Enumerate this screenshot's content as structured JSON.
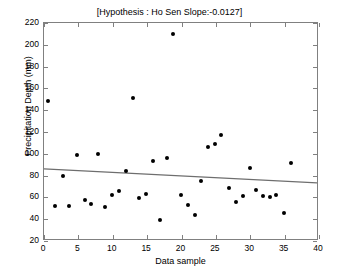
{
  "chart_data": {
    "type": "scatter",
    "title": "[Hypothesis : Ho Sen Slope:-0.0127]",
    "xlabel": "Data sample",
    "ylabel": "Precipitation Depth (mm)",
    "xlim": [
      0,
      40
    ],
    "ylim": [
      20,
      220
    ],
    "xticks": [
      0,
      5,
      10,
      15,
      20,
      25,
      30,
      35,
      40
    ],
    "yticks": [
      20,
      40,
      60,
      80,
      100,
      120,
      140,
      160,
      180,
      200,
      220
    ],
    "grid": false,
    "legend": null,
    "marker_color": "#000000",
    "trendline_color": "#6e6e6e",
    "axes_color": "#808080",
    "background": "#ffffff",
    "series": [
      {
        "name": "Precipitation Depth",
        "marker": "filled-circle",
        "points": [
          [
            0.6,
            148
          ],
          [
            1.6,
            52
          ],
          [
            2.7,
            80
          ],
          [
            3.7,
            52
          ],
          [
            4.8,
            99
          ],
          [
            5.9,
            58
          ],
          [
            6.8,
            54
          ],
          [
            7.9,
            100
          ],
          [
            8.8,
            51
          ],
          [
            9.9,
            62
          ],
          [
            10.9,
            66
          ],
          [
            11.9,
            84
          ],
          [
            12.9,
            151
          ],
          [
            13.8,
            59
          ],
          [
            14.9,
            63
          ],
          [
            15.9,
            93
          ],
          [
            16.9,
            39
          ],
          [
            17.9,
            96
          ],
          [
            18.8,
            210
          ],
          [
            19.9,
            62
          ],
          [
            20.9,
            53
          ],
          [
            21.9,
            44
          ],
          [
            22.9,
            75
          ],
          [
            23.8,
            106
          ],
          [
            24.8,
            109
          ],
          [
            25.8,
            117
          ],
          [
            26.9,
            69
          ],
          [
            27.9,
            56
          ],
          [
            28.9,
            61
          ],
          [
            29.9,
            87
          ],
          [
            30.9,
            67
          ],
          [
            31.9,
            61
          ],
          [
            32.9,
            60
          ],
          [
            33.8,
            62
          ],
          [
            34.9,
            46
          ],
          [
            35.9,
            92
          ]
        ]
      }
    ],
    "trendline": {
      "name": "Sen slope line",
      "slope": -0.0127,
      "x": [
        0,
        40
      ],
      "y": [
        85,
        72
      ]
    }
  }
}
